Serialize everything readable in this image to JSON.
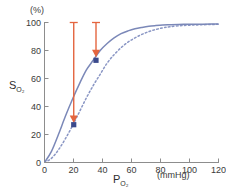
{
  "chart_data": {
    "type": "line",
    "title": "",
    "xlabel": "P",
    "xlabel_sub": "O2",
    "xunit": "(mmHg)",
    "ylabel": "S",
    "ylabel_sub": "O2",
    "yunit": "(%)",
    "xlim": [
      0,
      125
    ],
    "ylim": [
      0,
      105
    ],
    "xticks": [
      0,
      20,
      40,
      60,
      80,
      100,
      120
    ],
    "yticks": [
      0,
      20,
      40,
      60,
      80,
      100
    ],
    "grid": false,
    "legend": "none",
    "series": [
      {
        "name": "left-shifted-curve",
        "style": "solid",
        "color": "#7b88b8",
        "x": [
          0,
          5,
          10,
          15,
          20,
          25,
          30,
          35,
          40,
          45,
          50,
          55,
          60,
          65,
          70,
          75,
          80,
          85,
          90,
          100,
          110,
          120,
          125
        ],
        "values": [
          0,
          8,
          20,
          33,
          45,
          56,
          66,
          73,
          80,
          85,
          89,
          92,
          94,
          95.5,
          96.5,
          97.3,
          97.8,
          98.2,
          98.4,
          98.7,
          98.8,
          98.9,
          98.9
        ]
      },
      {
        "name": "right-shifted-curve",
        "style": "dotted",
        "color": "#8a96c4",
        "x": [
          0,
          5,
          10,
          15,
          20,
          25,
          30,
          35,
          40,
          45,
          50,
          55,
          60,
          65,
          70,
          75,
          80,
          85,
          90,
          100,
          110,
          120,
          125
        ],
        "values": [
          0,
          3,
          9,
          17,
          26,
          36,
          46,
          55,
          63,
          71,
          77,
          82,
          86,
          89,
          91.5,
          93.5,
          95,
          96.2,
          97,
          97.9,
          98.3,
          98.6,
          98.7
        ]
      }
    ],
    "annotations": [
      {
        "name": "arrow-low-po2",
        "kind": "down-arrow",
        "color": "#e4653f",
        "x": 21,
        "y_from": 100,
        "y_to": 30,
        "cap": "bar",
        "marker": {
          "name": "data-point-low",
          "shape": "square",
          "color": "#3b4a8c",
          "x": 21,
          "y": 27
        }
      },
      {
        "name": "arrow-high-po2",
        "kind": "down-arrow",
        "color": "#e4653f",
        "x": 37,
        "y_from": 100,
        "y_to": 77,
        "cap": "bar",
        "marker": {
          "name": "data-point-high",
          "shape": "square",
          "color": "#3b4a8c",
          "x": 37,
          "y": 73
        }
      }
    ]
  },
  "axes": {
    "x_tick_labels": [
      "0",
      "20",
      "40",
      "60",
      "80",
      "100",
      "120"
    ],
    "y_tick_labels": [
      "0",
      "20",
      "40",
      "60",
      "80",
      "100"
    ],
    "x_unit_label": "(mmHg)",
    "y_unit_label": "(%)",
    "x_title_main": "P",
    "x_title_sub": "O₂",
    "y_title_main": "S",
    "y_title_sub": "O₂"
  },
  "colors": {
    "curve_solid": "#7b88b8",
    "curve_dotted": "#8a96c4",
    "arrow": "#e4653f",
    "marker": "#3b4a8c",
    "axis": "#8d8d8d",
    "text": "#333333"
  }
}
